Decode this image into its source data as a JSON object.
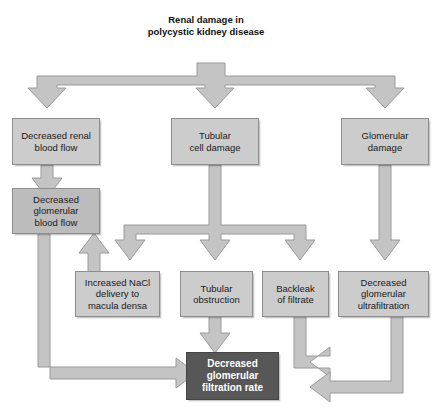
{
  "diagram": {
    "title": "Renal damage in polycystic kidney disease",
    "title_lines": [
      "Renal damage in",
      "polycystic kidney",
      "disease"
    ],
    "colors": {
      "arrow_fill": "#c4c4c4",
      "arrow_stroke": "#9a9a9a",
      "box_light": "#cccccc",
      "box_mid": "#bcbcbc",
      "box_dark": "#575757",
      "box_border": "#8d8d8d",
      "text_dark": "#1a1a1a",
      "text_light": "#ffffff",
      "background": "#ffffff"
    },
    "nodes": [
      {
        "id": "renal-blood-flow",
        "label": "Decreased renal blood flow",
        "lines": [
          "Decreased renal",
          "blood flow"
        ]
      },
      {
        "id": "tubular-cell-damage",
        "label": "Tubular cell damage",
        "lines": [
          "Tubular",
          "cell damage"
        ]
      },
      {
        "id": "glomerular-damage",
        "label": "Glomerular damage",
        "lines": [
          "Glomerular",
          "damage"
        ]
      },
      {
        "id": "glomerular-blood-flow",
        "label": "Decreased glomerular blood flow",
        "lines": [
          "Decreased",
          "glomerular",
          "blood flow"
        ]
      },
      {
        "id": "nacl-delivery",
        "label": "Increased NaCl delivery to macula densa",
        "lines": [
          "Increased NaCl",
          "delivery to",
          "macula densa"
        ]
      },
      {
        "id": "tubular-obstruction",
        "label": "Tubular obstruction",
        "lines": [
          "Tubular",
          "obstruction"
        ]
      },
      {
        "id": "backleak-filtrate",
        "label": "Backleak of filtrate",
        "lines": [
          "Backleak",
          "of filtrate"
        ]
      },
      {
        "id": "glomerular-ultrafilt",
        "label": "Decreased glomerular ultrafiltration",
        "lines": [
          "Decreased",
          "glomerular",
          "ultrafiltration"
        ]
      },
      {
        "id": "gfr",
        "label": "Decreased glomerular filtration rate",
        "lines": [
          "Decreased",
          "glomerular",
          "filtration rate"
        ]
      }
    ],
    "edges": [
      {
        "from": "title",
        "to": "renal-blood-flow"
      },
      {
        "from": "title",
        "to": "tubular-cell-damage"
      },
      {
        "from": "title",
        "to": "glomerular-damage"
      },
      {
        "from": "renal-blood-flow",
        "to": "glomerular-blood-flow"
      },
      {
        "from": "tubular-cell-damage",
        "to": "nacl-delivery"
      },
      {
        "from": "tubular-cell-damage",
        "to": "tubular-obstruction"
      },
      {
        "from": "tubular-cell-damage",
        "to": "backleak-filtrate"
      },
      {
        "from": "glomerular-damage",
        "to": "glomerular-ultrafilt"
      },
      {
        "from": "nacl-delivery",
        "to": "glomerular-blood-flow"
      },
      {
        "from": "glomerular-blood-flow",
        "to": "gfr"
      },
      {
        "from": "tubular-obstruction",
        "to": "gfr"
      },
      {
        "from": "backleak-filtrate",
        "to": "gfr"
      },
      {
        "from": "glomerular-ultrafilt",
        "to": "gfr"
      }
    ]
  }
}
